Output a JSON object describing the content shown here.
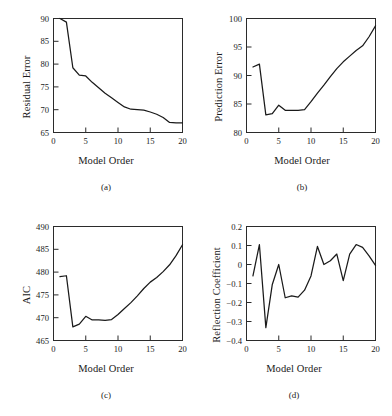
{
  "figure": {
    "panels": [
      {
        "caption": "(a)",
        "xlabel": "Model Order",
        "ylabel": "Residual Error"
      },
      {
        "caption": "(b)",
        "xlabel": "Model Order",
        "ylabel": "Prediction Error"
      },
      {
        "caption": "(c)",
        "xlabel": "Model Order",
        "ylabel": "AIC"
      },
      {
        "caption": "(d)",
        "xlabel": "Model Order",
        "ylabel": "Reflection Coefficient"
      }
    ]
  },
  "chart_data": [
    {
      "type": "line",
      "panel": "(a)",
      "title": "",
      "xlabel": "Model Order",
      "ylabel": "Residual Error",
      "xlim": [
        0,
        20
      ],
      "ylim": [
        65,
        90
      ],
      "xticks": [
        0,
        5,
        10,
        15,
        20
      ],
      "yticks": [
        65,
        70,
        75,
        80,
        85,
        90
      ],
      "xtick_labels": [
        "0",
        "5",
        "10",
        "15",
        "20"
      ],
      "ytick_labels": [
        "65",
        "70",
        "75",
        "80",
        "85",
        "90"
      ],
      "grid": false,
      "legend": false,
      "x": [
        1,
        2,
        3,
        4,
        5,
        6,
        7,
        8,
        9,
        10,
        11,
        12,
        13,
        14,
        15,
        16,
        17,
        18,
        19,
        20
      ],
      "y": [
        90.0,
        89.2,
        79.2,
        77.6,
        77.4,
        76.0,
        74.8,
        73.6,
        72.6,
        71.6,
        70.6,
        70.1,
        70.0,
        69.9,
        69.5,
        69.0,
        68.3,
        67.2,
        67.1,
        67.1
      ]
    },
    {
      "type": "line",
      "panel": "(b)",
      "title": "",
      "xlabel": "Model Order",
      "ylabel": "Prediction Error",
      "xlim": [
        0,
        20
      ],
      "ylim": [
        80,
        100
      ],
      "xticks": [
        0,
        5,
        10,
        15,
        20
      ],
      "yticks": [
        80,
        85,
        90,
        95,
        100
      ],
      "xtick_labels": [
        "0",
        "5",
        "10",
        "15",
        "20"
      ],
      "ytick_labels": [
        "80",
        "85",
        "90",
        "95",
        "100"
      ],
      "grid": false,
      "legend": false,
      "x": [
        1,
        2,
        3,
        4,
        5,
        6,
        7,
        8,
        9,
        10,
        11,
        12,
        13,
        14,
        15,
        16,
        17,
        18,
        19,
        20
      ],
      "y": [
        91.5,
        92.0,
        83.1,
        83.3,
        84.8,
        83.9,
        83.9,
        83.9,
        84.0,
        85.4,
        86.9,
        88.3,
        89.8,
        91.2,
        92.4,
        93.4,
        94.4,
        95.2,
        96.8,
        98.7
      ]
    },
    {
      "type": "line",
      "panel": "(c)",
      "title": "",
      "xlabel": "Model Order",
      "ylabel": "AIC",
      "xlim": [
        0,
        20
      ],
      "ylim": [
        465,
        490
      ],
      "xticks": [
        0,
        5,
        10,
        15,
        20
      ],
      "yticks": [
        465,
        470,
        475,
        480,
        485,
        490
      ],
      "xtick_labels": [
        "0",
        "5",
        "10",
        "15",
        "20"
      ],
      "ytick_labels": [
        "465",
        "470",
        "475",
        "480",
        "485",
        "490"
      ],
      "grid": false,
      "legend": false,
      "x": [
        1,
        2,
        3,
        4,
        5,
        6,
        7,
        8,
        9,
        10,
        11,
        12,
        13,
        14,
        15,
        16,
        17,
        18,
        19,
        20
      ],
      "y": [
        479.0,
        479.2,
        468.0,
        468.6,
        470.3,
        469.5,
        469.5,
        469.4,
        469.6,
        470.7,
        472.0,
        473.3,
        474.8,
        476.4,
        477.8,
        478.8,
        480.1,
        481.6,
        483.6,
        486.0
      ]
    },
    {
      "type": "line",
      "panel": "(d)",
      "title": "",
      "xlabel": "Model Order",
      "ylabel": "Reflection Coefficient",
      "xlim": [
        0,
        20
      ],
      "ylim": [
        -0.4,
        0.2
      ],
      "xticks": [
        0,
        5,
        10,
        15,
        20
      ],
      "yticks": [
        -0.4,
        -0.3,
        -0.2,
        -0.1,
        0,
        0.1,
        0.2
      ],
      "xtick_labels": [
        "0",
        "5",
        "10",
        "15",
        "20"
      ],
      "ytick_labels": [
        "−0.4",
        "−0.3",
        "−0.2",
        "−0.1",
        "0",
        "0.1",
        "0.2"
      ],
      "grid": false,
      "legend": false,
      "x": [
        1,
        2,
        3,
        4,
        5,
        6,
        7,
        8,
        9,
        10,
        11,
        12,
        13,
        14,
        15,
        16,
        17,
        18,
        19,
        20
      ],
      "y": [
        -0.06,
        0.105,
        -0.332,
        -0.105,
        0.0,
        -0.175,
        -0.165,
        -0.172,
        -0.135,
        -0.06,
        0.095,
        0.0,
        0.02,
        0.055,
        -0.085,
        0.055,
        0.105,
        0.09,
        0.045,
        -0.005
      ]
    }
  ]
}
